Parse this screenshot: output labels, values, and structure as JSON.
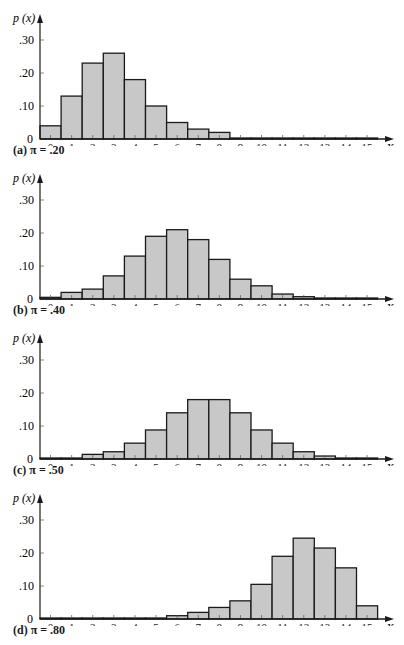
{
  "chart_data": [
    {
      "type": "bar",
      "title": "(a) π = .20",
      "panel_label": "(a)",
      "pi_label": "π =",
      "pi_value": ".20",
      "ylabel": "p(x)",
      "xlabel": "X",
      "categories": [
        "0",
        "1",
        "2",
        "3",
        "4",
        "5",
        "6",
        "7",
        "8",
        "9",
        "10",
        "11",
        "12",
        "13",
        "14",
        "15"
      ],
      "values": [
        0.04,
        0.13,
        0.23,
        0.26,
        0.18,
        0.1,
        0.05,
        0.03,
        0.02,
        0.003,
        0.001,
        0.0,
        0.0,
        0.0,
        0.0,
        0.0
      ],
      "yticks": [
        "0",
        ".10",
        ".20",
        ".30"
      ],
      "ylim": [
        0,
        0.33
      ],
      "grid": false,
      "legend": null
    },
    {
      "type": "bar",
      "title": "(b) π = .40",
      "panel_label": "(b)",
      "pi_label": "π =",
      "pi_value": ".40",
      "ylabel": "p(x)",
      "xlabel": "X",
      "categories": [
        "0",
        "1",
        "2",
        "3",
        "4",
        "5",
        "6",
        "7",
        "8",
        "9",
        "10",
        "11",
        "12",
        "13",
        "14",
        "15"
      ],
      "values": [
        0.005,
        0.02,
        0.03,
        0.07,
        0.13,
        0.19,
        0.21,
        0.18,
        0.12,
        0.06,
        0.04,
        0.015,
        0.007,
        0.002,
        0.001,
        0.0
      ],
      "yticks": [
        "0",
        ".10",
        ".20",
        ".30"
      ],
      "ylim": [
        0,
        0.33
      ],
      "grid": false,
      "legend": null
    },
    {
      "type": "bar",
      "title": "(c) π = .50",
      "panel_label": "(c)",
      "pi_label": "π =",
      "pi_value": ".50",
      "ylabel": "p(x)",
      "xlabel": "X",
      "categories": [
        "0",
        "1",
        "2",
        "3",
        "4",
        "5",
        "6",
        "7",
        "8",
        "9",
        "10",
        "11",
        "12",
        "13",
        "14",
        "15"
      ],
      "values": [
        0.002,
        0.002,
        0.014,
        0.022,
        0.048,
        0.088,
        0.14,
        0.18,
        0.18,
        0.14,
        0.088,
        0.048,
        0.022,
        0.009,
        0.002,
        0.002
      ],
      "yticks": [
        "0",
        ".10",
        ".20",
        ".30"
      ],
      "ylim": [
        0,
        0.33
      ],
      "grid": false,
      "legend": null
    },
    {
      "type": "bar",
      "title": "(d) π = .80",
      "panel_label": "(d)",
      "pi_label": "π =",
      "pi_value": ".80",
      "ylabel": "p(x)",
      "xlabel": "X",
      "categories": [
        "0",
        "1",
        "2",
        "3",
        "4",
        "5",
        "6",
        "7",
        "8",
        "9",
        "10",
        "11",
        "12",
        "13",
        "14",
        "15"
      ],
      "values": [
        0.002,
        0.002,
        0.002,
        0.002,
        0.002,
        0.002,
        0.01,
        0.02,
        0.035,
        0.055,
        0.105,
        0.19,
        0.245,
        0.215,
        0.155,
        0.04
      ],
      "yticks": [
        "0",
        ".10",
        ".20",
        ".30"
      ],
      "ylim": [
        0,
        0.33
      ],
      "grid": false,
      "legend": null
    }
  ],
  "style": {
    "bar_fill": "#c8c8c8",
    "bar_stroke": "#1a1a1a",
    "axis_color": "#1a1a1a",
    "background": "#ffffff"
  },
  "panels": [
    {
      "caption": "(a) π = .20"
    },
    {
      "caption": "(b) π = .40"
    },
    {
      "caption": "(c) π = .50"
    },
    {
      "caption": "(d) π = .80"
    }
  ]
}
